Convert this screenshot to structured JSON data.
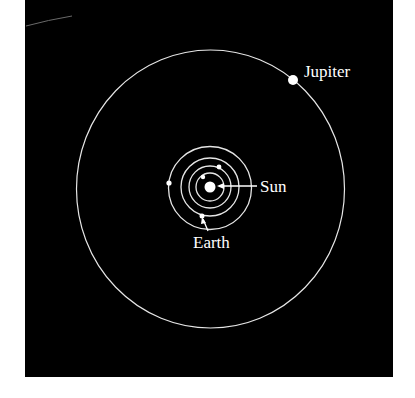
{
  "diagram": {
    "background_color": "#000000",
    "page_color": "#ffffff",
    "line_color": "#e6e6e6",
    "panel": {
      "x": 25,
      "y": 0,
      "width": 368,
      "height": 377
    },
    "sun": {
      "cx": 210,
      "cy": 187,
      "r": 5.5
    },
    "inner_orbits": [
      {
        "name": "mercury-orbit",
        "r": 14
      },
      {
        "name": "venus-orbit",
        "r": 21
      },
      {
        "name": "earth-orbit",
        "r": 29
      },
      {
        "name": "mars-orbit",
        "r": 42
      }
    ],
    "outer_orbit": {
      "name": "jupiter-orbit",
      "cx": 210.5,
      "cy": 189,
      "rx": 134,
      "ry": 139
    },
    "planets": [
      {
        "name": "mercury",
        "cx": 203,
        "cy": 177,
        "r": 2.2
      },
      {
        "name": "venus",
        "cx": 219,
        "cy": 167,
        "r": 2.4
      },
      {
        "name": "earth",
        "cx": 202,
        "cy": 216,
        "r": 2.5
      },
      {
        "name": "mars",
        "cx": 169,
        "cy": 183,
        "r": 2.6
      },
      {
        "name": "jupiter",
        "cx": 293,
        "cy": 80,
        "r": 5
      }
    ],
    "labels": {
      "jupiter": "Jupiter",
      "sun": "Sun",
      "earth": "Earth"
    }
  }
}
